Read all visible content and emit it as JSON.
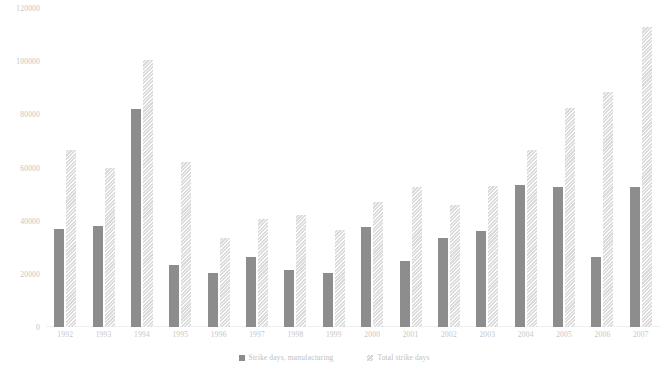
{
  "chart_data": {
    "type": "bar",
    "title": "",
    "xlabel": "",
    "ylabel": "",
    "ylim": [
      0,
      120000
    ],
    "yticks": [
      0,
      20000,
      40000,
      60000,
      80000,
      100000,
      120000
    ],
    "ytick_labels": [
      "0",
      "20000",
      "40000",
      "60000",
      "80000",
      "100000",
      "120000"
    ],
    "grid": false,
    "legend_position": "bottom",
    "categories": [
      "1992",
      "1993",
      "1994",
      "1995",
      "1996",
      "1997",
      "1998",
      "1999",
      "2000",
      "2001",
      "2002",
      "2003",
      "2004",
      "2005",
      "2006",
      "2007"
    ],
    "series": [
      {
        "name": "Strike days, manufacturing",
        "color": "#8d8d8d",
        "values": [
          37000,
          38000,
          82000,
          23500,
          20500,
          26500,
          21500,
          20500,
          37500,
          25000,
          33500,
          36000,
          53500,
          52500,
          26500,
          52500
        ]
      },
      {
        "name": "Total strike days",
        "color": "#e2e2e2",
        "values": [
          66500,
          60000,
          100500,
          62000,
          33500,
          40500,
          42000,
          36500,
          47000,
          52500,
          46000,
          53000,
          66500,
          82500,
          88500,
          113000
        ]
      }
    ]
  },
  "legend": {
    "items": [
      {
        "label": "Strike days, manufacturing",
        "swatch": "manufacturing"
      },
      {
        "label": "Total strike days",
        "swatch": "total"
      }
    ]
  }
}
